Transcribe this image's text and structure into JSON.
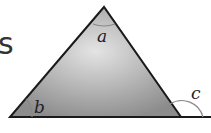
{
  "diagram": {
    "type": "triangle-exterior-angle",
    "partial_text": "s",
    "labels": {
      "apex_angle": "a",
      "left_base_angle": "b",
      "exterior_angle": "c"
    },
    "colors": {
      "fill_center": "#e2e2e2",
      "fill_edge": "#8f8f8f",
      "stroke": "#1a1a1a",
      "arc": "#888888"
    }
  }
}
